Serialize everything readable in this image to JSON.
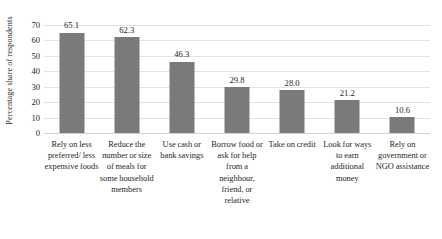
{
  "chart_data": {
    "type": "bar",
    "title": "",
    "subtitle": "",
    "xlabel": "",
    "ylabel": "Percentage share of respondents",
    "ylim": [
      0,
      70
    ],
    "ytick_step": 10,
    "yticks": [
      "70",
      "60",
      "50",
      "40",
      "30",
      "20",
      "10",
      "0"
    ],
    "grid": true,
    "legend": "none",
    "bar_color": "#7a7a7a",
    "gridline_color": "#e3e3e3",
    "background_color": "#ffffff",
    "categories": [
      "Rely on less preferred/ less expensive foods",
      "Reduce the number or size of meals for some household members",
      "Use cash or bank savings",
      "Borrow food or ask for help from a neighbour, friend, or relative",
      "Take on credit",
      "Look for ways to earn additional money",
      "Rely on government or NGO assistance"
    ],
    "values": [
      65.1,
      62.3,
      46.3,
      29.8,
      28.0,
      21.2,
      10.6
    ],
    "value_labels": [
      "65.1",
      "62.3",
      "46.3",
      "29.8",
      "28.0",
      "21.2",
      "10.6"
    ]
  }
}
